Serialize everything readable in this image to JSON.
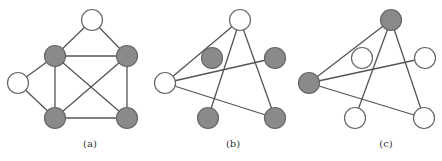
{
  "colors": {
    "filled": "#8a8a8a",
    "empty": "#ffffff",
    "edge": "#555555"
  },
  "graphs": [
    {
      "id": "a",
      "label": "(a)",
      "nodes": [
        {
          "id": "top",
          "filled": false
        },
        {
          "id": "tl",
          "filled": true
        },
        {
          "id": "tr",
          "filled": true
        },
        {
          "id": "left",
          "filled": false
        },
        {
          "id": "bl",
          "filled": true
        },
        {
          "id": "br",
          "filled": true
        }
      ],
      "edges": [
        [
          "top",
          "tl"
        ],
        [
          "top",
          "tr"
        ],
        [
          "tl",
          "tr"
        ],
        [
          "tl",
          "left"
        ],
        [
          "left",
          "bl"
        ],
        [
          "tl",
          "bl"
        ],
        [
          "tr",
          "br"
        ],
        [
          "bl",
          "br"
        ],
        [
          "tl",
          "br"
        ],
        [
          "tr",
          "bl"
        ]
      ]
    },
    {
      "id": "b",
      "label": "(b)",
      "nodes": [
        {
          "id": "top",
          "filled": false
        },
        {
          "id": "inner",
          "filled": true
        },
        {
          "id": "right",
          "filled": true
        },
        {
          "id": "left",
          "filled": false
        },
        {
          "id": "bl",
          "filled": true
        },
        {
          "id": "br",
          "filled": true
        }
      ],
      "edges": [
        [
          "left",
          "top"
        ],
        [
          "top",
          "bl"
        ],
        [
          "top",
          "br"
        ],
        [
          "left",
          "right"
        ],
        [
          "left",
          "br"
        ]
      ]
    },
    {
      "id": "c",
      "label": "(c)",
      "nodes": [
        {
          "id": "top",
          "filled": true
        },
        {
          "id": "inner",
          "filled": false
        },
        {
          "id": "right",
          "filled": false
        },
        {
          "id": "left",
          "filled": true
        },
        {
          "id": "bl",
          "filled": false
        },
        {
          "id": "br",
          "filled": false
        }
      ],
      "edges": [
        [
          "left",
          "top"
        ],
        [
          "top",
          "bl"
        ],
        [
          "top",
          "br"
        ],
        [
          "left",
          "right"
        ],
        [
          "left",
          "br"
        ]
      ]
    }
  ]
}
